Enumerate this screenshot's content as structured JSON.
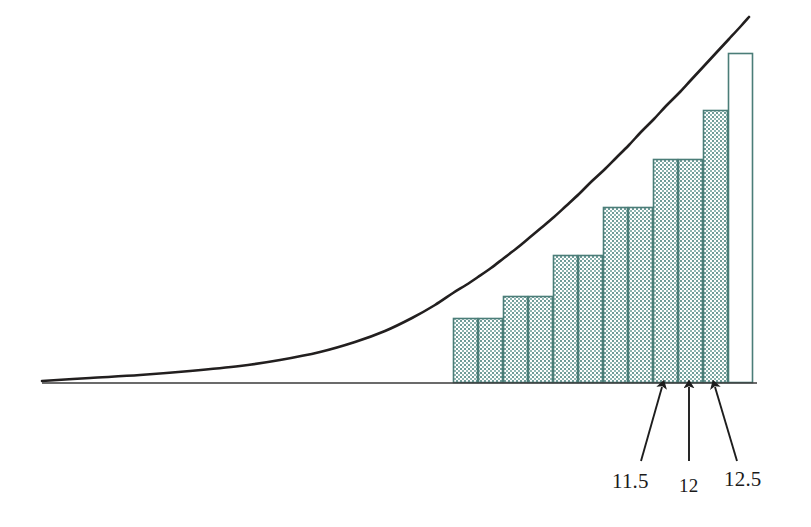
{
  "figure": {
    "title": "",
    "background_color": "#ffffff",
    "curve_color": "#221f1f",
    "axis_color": "#3a3a3a",
    "bar_stroke_color": "#4b7d78",
    "bar_fill_color": "#5d8f8a",
    "arrow_color": "#1d1d1d",
    "label_color": "#1a1a1a"
  },
  "axis": {
    "baseline_y": 383,
    "x_start": 42,
    "x_end": 757
  },
  "annotations": {
    "arrows": [
      {
        "name": "arrow-11-5",
        "tip_x": 662,
        "tip_y": 387,
        "tail_x": 641,
        "tail_y": 461
      },
      {
        "name": "arrow-12",
        "tip_x": 689,
        "tip_y": 387,
        "tail_x": 689,
        "tail_y": 461
      },
      {
        "name": "arrow-12-5",
        "tip_x": 715,
        "tip_y": 387,
        "tail_x": 737,
        "tail_y": 461
      }
    ],
    "labels": [
      {
        "name": "tick-label-11-5",
        "text": "11.5",
        "x": 612,
        "y": 471
      },
      {
        "name": "tick-label-12",
        "text": "12",
        "x": 679,
        "y": 476
      },
      {
        "name": "tick-label-12-5",
        "text": "12.5",
        "x": 724,
        "y": 469
      }
    ]
  },
  "chart_data": {
    "type": "bar",
    "subtitle": "",
    "xlabel": "",
    "ylabel": "",
    "grid": false,
    "legend": null,
    "x_axis_tick_labels": [
      "11.5",
      "12",
      "12.5"
    ],
    "x_axis_tick_pixel_positions": [
      662,
      689,
      715
    ],
    "bar_pixel_left": 453,
    "bar_pixel_right": 753,
    "bar_pixel_width": 25,
    "baseline_pixel_y": 383,
    "categories": [
      "b1",
      "b2",
      "b3",
      "b4",
      "b5",
      "b6",
      "b7",
      "b8",
      "b9",
      "b10",
      "b11",
      "b12"
    ],
    "bar_top_pixel_y": [
      318,
      318,
      296,
      296,
      255,
      255,
      207,
      207,
      159,
      159,
      110,
      53
    ],
    "values": [
      65,
      65,
      87,
      87,
      128,
      128,
      176,
      176,
      224,
      224,
      273,
      330
    ],
    "bar_filled": [
      true,
      true,
      true,
      true,
      true,
      true,
      true,
      true,
      true,
      true,
      true,
      false
    ],
    "ylim": [
      0,
      365
    ],
    "curve": {
      "name": "increasing-convex-curve",
      "pixel_points": [
        [
          42,
          381
        ],
        [
          90,
          378
        ],
        [
          140,
          375
        ],
        [
          190,
          371
        ],
        [
          240,
          366
        ],
        [
          280,
          360
        ],
        [
          320,
          352
        ],
        [
          355,
          342
        ],
        [
          385,
          331
        ],
        [
          412,
          318
        ],
        [
          435,
          305
        ],
        [
          453,
          293
        ],
        [
          466,
          285
        ],
        [
          478,
          277
        ],
        [
          491,
          268
        ],
        [
          504,
          258
        ],
        [
          517,
          248
        ],
        [
          529,
          238
        ],
        [
          541,
          228
        ],
        [
          554,
          217
        ],
        [
          566,
          206
        ],
        [
          579,
          194
        ],
        [
          591,
          182
        ],
        [
          604,
          170
        ],
        [
          616,
          158
        ],
        [
          629,
          145
        ],
        [
          641,
          132
        ],
        [
          654,
          119
        ],
        [
          666,
          106
        ],
        [
          679,
          93
        ],
        [
          691,
          80
        ],
        [
          704,
          66
        ],
        [
          716,
          53
        ],
        [
          729,
          39
        ],
        [
          741,
          26
        ],
        [
          749,
          17
        ]
      ]
    }
  }
}
